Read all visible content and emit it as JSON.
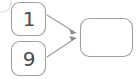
{
  "diagram": {
    "background_color": "#ffffff",
    "stroke_color": "#9a9a9a",
    "text_color": "#4a4a4a",
    "arrow_color": "#8f8f8f",
    "corner_arc_color": "#e2e2e2",
    "nodes": [
      {
        "id": "node-one",
        "name": "node-one",
        "label": "1",
        "shape": "rounded-square",
        "x": 11,
        "y": 2,
        "width": 35,
        "height": 34,
        "radius": 8
      },
      {
        "id": "node-nine",
        "name": "node-nine",
        "label": "9",
        "shape": "rounded-square",
        "x": 11,
        "y": 41,
        "width": 35,
        "height": 35,
        "radius": 8
      },
      {
        "id": "node-target",
        "name": "node-target",
        "label": "",
        "shape": "rounded-rectangle",
        "x": 80,
        "y": 18,
        "width": 53,
        "height": 39,
        "radius": 9
      }
    ],
    "edges": [
      {
        "id": "edge-one-to-target",
        "name": "edge-one-to-target",
        "from": "node-one",
        "to": "node-target",
        "x1": 47,
        "y1": 15,
        "x2": 77,
        "y2": 32,
        "arrowhead": "filled-triangle"
      },
      {
        "id": "edge-nine-to-target",
        "name": "edge-nine-to-target",
        "from": "node-nine",
        "to": "node-target",
        "x1": 47,
        "y1": 57,
        "x2": 77,
        "y2": 38,
        "arrowhead": "filled-triangle"
      }
    ],
    "decorations": [
      {
        "id": "corner-arc",
        "name": "corner-arc-decoration",
        "cx": 2,
        "cy": 3,
        "rx": 9,
        "ry": 9
      }
    ]
  }
}
